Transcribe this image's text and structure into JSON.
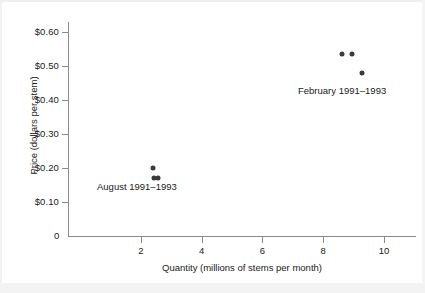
{
  "chart_data": {
    "type": "scatter",
    "title": "",
    "xlabel": "Quantity (millions of stems per month)",
    "ylabel": "Price (dollars per stem)",
    "xlim": [
      0,
      11.4
    ],
    "ylim": [
      0,
      0.655
    ],
    "grid": false,
    "legend": "none",
    "origin_label": "0",
    "xticks": [
      2,
      4,
      6,
      8,
      10
    ],
    "xticklabels": [
      "2",
      "4",
      "6",
      "8",
      "10"
    ],
    "yticks": [
      0.1,
      0.2,
      0.3,
      0.4,
      0.5,
      0.6
    ],
    "yticklabels": [
      "$0.10",
      "$0.20",
      "$0.30",
      "$0.40",
      "$0.50",
      "$0.60"
    ],
    "marker_color": "#3a3a3a",
    "axis_color": "#8a8a8a",
    "series": [
      {
        "name": "August 1991–1993",
        "points": [
          {
            "x": 2.4,
            "y": 0.2
          },
          {
            "x": 2.44,
            "y": 0.172
          },
          {
            "x": 2.56,
            "y": 0.17
          }
        ]
      },
      {
        "name": "February 1991–1993",
        "points": [
          {
            "x": 8.62,
            "y": 0.536
          },
          {
            "x": 8.95,
            "y": 0.536
          },
          {
            "x": 9.26,
            "y": 0.478
          }
        ]
      }
    ],
    "annotations": [
      {
        "text": "August 1991–1993",
        "x_px": 97,
        "y_px": 181
      },
      {
        "text": "February 1991–1993",
        "x_px": 298,
        "y_px": 85
      }
    ]
  }
}
